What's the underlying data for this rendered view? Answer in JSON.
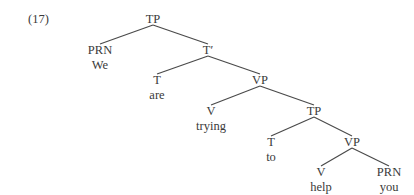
{
  "example_number": "(17)",
  "colors": {
    "line": "#4a4a4a",
    "text": "#3a3a3a",
    "background": "#ffffff"
  },
  "nodes": [
    {
      "id": "tp1",
      "label": "TP",
      "x": 153,
      "y": 12
    },
    {
      "id": "prn1",
      "label": "PRN",
      "x": 100,
      "y": 43,
      "word": "We"
    },
    {
      "id": "tbar",
      "label": "T′",
      "x": 208,
      "y": 43
    },
    {
      "id": "t1",
      "label": "T",
      "x": 157,
      "y": 73,
      "word": "are"
    },
    {
      "id": "vp1",
      "label": "VP",
      "x": 260,
      "y": 73
    },
    {
      "id": "v1",
      "label": "V",
      "x": 211,
      "y": 104,
      "word": "trying"
    },
    {
      "id": "tp2",
      "label": "TP",
      "x": 314,
      "y": 104
    },
    {
      "id": "t2",
      "label": "T",
      "x": 271,
      "y": 135,
      "word": "to"
    },
    {
      "id": "vp2",
      "label": "VP",
      "x": 352,
      "y": 135
    },
    {
      "id": "v2",
      "label": "V",
      "x": 321,
      "y": 165,
      "word": "help"
    },
    {
      "id": "prn2",
      "label": "PRN",
      "x": 389,
      "y": 165,
      "word": "you"
    }
  ],
  "edges": [
    [
      "tp1",
      "prn1"
    ],
    [
      "tp1",
      "tbar"
    ],
    [
      "tbar",
      "t1"
    ],
    [
      "tbar",
      "vp1"
    ],
    [
      "vp1",
      "v1"
    ],
    [
      "vp1",
      "tp2"
    ],
    [
      "tp2",
      "t2"
    ],
    [
      "tp2",
      "vp2"
    ],
    [
      "vp2",
      "v2"
    ],
    [
      "vp2",
      "prn2"
    ]
  ]
}
